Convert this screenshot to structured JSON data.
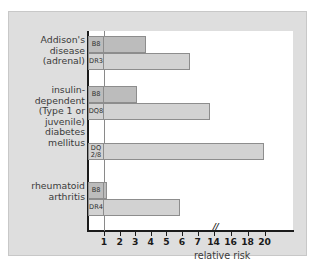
{
  "chart_data": {
    "type": "bar",
    "orientation": "horizontal",
    "title": "",
    "xlabel": "relative risk",
    "ylabel": "",
    "grid": false,
    "legend": "none",
    "axis_break": {
      "symbol": "//",
      "after_value": 7,
      "note": "x-axis scale breaks after 7 and resumes at 14"
    },
    "xticks": [
      1,
      2,
      3,
      4,
      5,
      6,
      7,
      14,
      16,
      18,
      20
    ],
    "xtick_labels": [
      "1",
      "2",
      "3",
      "4",
      "5",
      "6",
      "7",
      "14",
      "16",
      "18",
      "20"
    ],
    "xlim": [
      0,
      20
    ],
    "reference_line": 1,
    "categories": [
      "Addison's\ndisease\n(adrenal)",
      "insulin-\ndependent\n(Type 1 or\njuvenile)\ndiabetes\nmellitus",
      "rheumatoid\narthritis"
    ],
    "groups": [
      {
        "category": "Addison's\ndisease\n(adrenal)",
        "bars": [
          {
            "allele": "B8",
            "value": 3.7,
            "shade": "dark"
          },
          {
            "allele": "DR3",
            "value": 6.5,
            "shade": "light"
          }
        ]
      },
      {
        "category": "insulin-\ndependent\n(Type 1 or\njuvenile)\ndiabetes\nmellitus",
        "bars": [
          {
            "allele": "B8",
            "value": 3.1,
            "shade": "dark"
          },
          {
            "allele": "DQ8",
            "value": 13.6,
            "shade": "light"
          },
          {
            "allele": "DQ\n2/8",
            "value": 19.9,
            "shade": "light"
          }
        ]
      },
      {
        "category": "rheumatoid\narthritis",
        "bars": [
          {
            "allele": "B8",
            "value": 1.2,
            "shade": "dark"
          },
          {
            "allele": "DR4",
            "value": 5.9,
            "shade": "light"
          }
        ]
      }
    ],
    "colors": {
      "bar_light": "#d2d2d2",
      "bar_dark": "#bcbcbc",
      "bar_border": "#8d8d8d",
      "axis": "#1b1b1b",
      "reference_line": "#8a8a8a",
      "panel_background": "#dedede",
      "plot_background": "#ffffff",
      "text": "#3a3a3a"
    }
  },
  "labels": {
    "addisons": "Addison's\ndisease\n(adrenal)",
    "insulin": "insulin-\ndependent\n(Type 1 or\njuvenile)\ndiabetes\nmellitus",
    "rheumatoid": "rheumatoid\narthritis",
    "xtitle": "relative risk",
    "break_symbol": "//"
  }
}
